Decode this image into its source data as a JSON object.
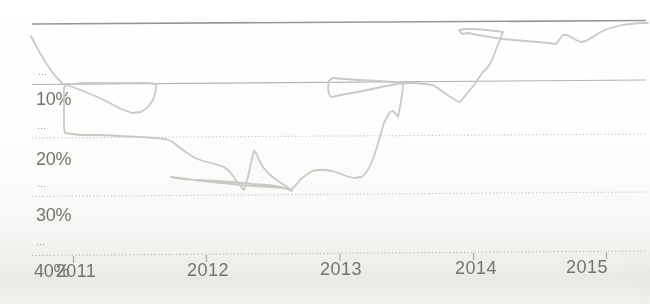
{
  "chart_data": {
    "type": "line",
    "title": "",
    "subtitle": "",
    "legend": "none",
    "grid": "horizontal-only",
    "x_tick_labels": [
      "2011",
      "2012",
      "2013",
      "2014",
      "2015"
    ],
    "y_tick_labels": [
      "10%",
      "20%",
      "30%",
      "40%"
    ],
    "y_axis": {
      "unit": "%",
      "direction": "inverted-larger-values-downward",
      "min": 0,
      "max": 40,
      "labeled_ticks": [
        10,
        20,
        30,
        40
      ]
    },
    "x_range_years": [
      2010.7,
      2015.35
    ],
    "series": [
      {
        "name": "probability-line",
        "note": "single light-gray line; photo shows it doubling back in thin sliver loops near 2012, 2013 and 2014",
        "approx_points_year_pct": [
          [
            2010.69,
            2
          ],
          [
            2010.85,
            7
          ],
          [
            2010.93,
            10
          ],
          [
            2011.3,
            10
          ],
          [
            2011.55,
            15
          ],
          [
            2011.62,
            10
          ],
          [
            2010.93,
            19
          ],
          [
            2011.5,
            19.5
          ],
          [
            2011.73,
            21
          ],
          [
            2012.05,
            24
          ],
          [
            2012.28,
            29
          ],
          [
            2012.36,
            22
          ],
          [
            2012.55,
            28
          ],
          [
            2012.64,
            29.5
          ],
          [
            2011.72,
            27
          ],
          [
            2012.64,
            29.5
          ],
          [
            2012.85,
            25.5
          ],
          [
            2013.1,
            26
          ],
          [
            2013.3,
            16
          ],
          [
            2013.45,
            10.5
          ],
          [
            2012.92,
            9.5
          ],
          [
            2012.94,
            13
          ],
          [
            2013.48,
            10.5
          ],
          [
            2013.7,
            10.5
          ],
          [
            2013.9,
            14
          ],
          [
            2014.1,
            8
          ],
          [
            2014.22,
            2
          ],
          [
            2013.89,
            1.5
          ],
          [
            2014.62,
            4
          ],
          [
            2014.7,
            2.5
          ],
          [
            2014.8,
            4
          ],
          [
            2014.9,
            3.7
          ],
          [
            2015.05,
            2
          ],
          [
            2015.35,
            0.5
          ]
        ]
      }
    ],
    "line_path_px": "31,36 35,44 40,53 46,63 52,72 58,79 63,84 72,84 85,83 100,83 118,83 135,83 148,83 156,84 156,90 153,100 148,107 141,112 132,113 121,109 108,102 95,96 83,91 73,87 66,85 64,88 64,100 64,115 64,128 65,133 80,135 100,135 120,136 140,137 155,138 165,139 171,141 179,147 187,153 195,158 203,161 211,163 218,165 224,167 229,171 233,176 237,182 241,187 244,190 248,177 251,163 254,151 256,153 259,160 263,167 268,173 274,178 281,183 287,187 292,191 284,188 270,187 252,186 232,184 212,182 194,180 180,178 171,177 182,179 198,180 216,181 234,182 252,184 268,185 281,187 291,190 296,185 301,179 306,175 312,171 318,170 325,170 332,171 339,173 346,176 354,178 362,177 368,170 373,159 377,147 381,133 384,123 387,117 390,112 393,111 396,114 398,117 400,107 402,95 403,86 404,83 394,82 378,81 360,80 344,79 332,78 329,81 328,88 329,94 331,97 346,94 363,91 381,87 397,84 405,83 414,83 425,84 433,85 439,89 446,94 452,98 457,101 460,102 465,96 470,90 474,85 478,79 483,72 487,68 491,62 494,55 497,47 500,40 502,34 503,32 496,31 486,30 475,29 465,29 459,30 462,34 468,33 478,35 490,37 502,39 514,40 526,41 538,42 549,43 556,44 559,40 563,35 567,35 571,37 576,40 581,42 586,41 591,38 596,35 601,32 607,29 614,27 622,25 631,24 640,23 648,23",
    "render": {
      "x_start": 32,
      "x_end": 646,
      "tick_len": 7,
      "line_width": 1.8,
      "font_size_y": 18,
      "font_size_x": 18,
      "letter_spacing_y": "-0.3",
      "letter_spacing_x": "0.5",
      "smudge_glyph": "⋯",
      "colors": {
        "line": "#c9c9c6",
        "grid_dark": "#98978f",
        "grid_solid": "#b3b3b0",
        "grid_dotted": "#c1c1be",
        "axis_dotted": "#b6b6b3",
        "tick": "#a9a9a5",
        "text": "#74736d",
        "smudge": "#95948e"
      },
      "gridlines": [
        {
          "id": "0pct",
          "y_left": 24.0,
          "y_right": 20.5,
          "style": "solid",
          "width": 1.7,
          "color_key": "grid_dark"
        },
        {
          "id": "10pct",
          "y_left": 84.5,
          "y_right": 80.0,
          "style": "solid",
          "width": 1.2,
          "color_key": "grid_solid"
        },
        {
          "id": "20pct",
          "y_left": 138.0,
          "y_right": 134.0,
          "style": "dotted",
          "width": 1.1,
          "color_key": "grid_dotted"
        },
        {
          "id": "30pct",
          "y_left": 196.5,
          "y_right": 192.0,
          "style": "dotted",
          "width": 1.1,
          "color_key": "grid_dotted"
        },
        {
          "id": "40pct-axis",
          "y_left": 255.5,
          "y_right": 251.0,
          "style": "dotted",
          "width": 1.1,
          "color_key": "axis_dotted"
        }
      ],
      "dash_pattern": "1.2 2.4",
      "y_labels": [
        {
          "label": "10%",
          "x": 36,
          "y": 105
        },
        {
          "label": "20%",
          "x": 36,
          "y": 165
        },
        {
          "label": "30%",
          "x": 36,
          "y": 221
        },
        {
          "label": "40%",
          "x": 34,
          "y": 277
        }
      ],
      "x_ticks": [
        {
          "label": "2011",
          "x": 73.5,
          "tick_top": 256.0,
          "label_x": 76,
          "label_y": 277
        },
        {
          "label": "2012",
          "x": 206.5,
          "tick_top": 255.0,
          "label_x": 208,
          "label_y": 276
        },
        {
          "label": "2013",
          "x": 340.0,
          "tick_top": 254.0,
          "label_x": 341,
          "label_y": 275
        },
        {
          "label": "2014",
          "x": 473.5,
          "tick_top": 253.0,
          "label_x": 476,
          "label_y": 274
        },
        {
          "label": "2015",
          "x": 606.5,
          "tick_top": 252.0,
          "label_x": 587,
          "label_y": 273
        }
      ],
      "smudges": [
        {
          "x": 38,
          "y": 78
        },
        {
          "x": 37,
          "y": 132
        },
        {
          "x": 37,
          "y": 190
        },
        {
          "x": 36,
          "y": 248
        }
      ]
    }
  }
}
